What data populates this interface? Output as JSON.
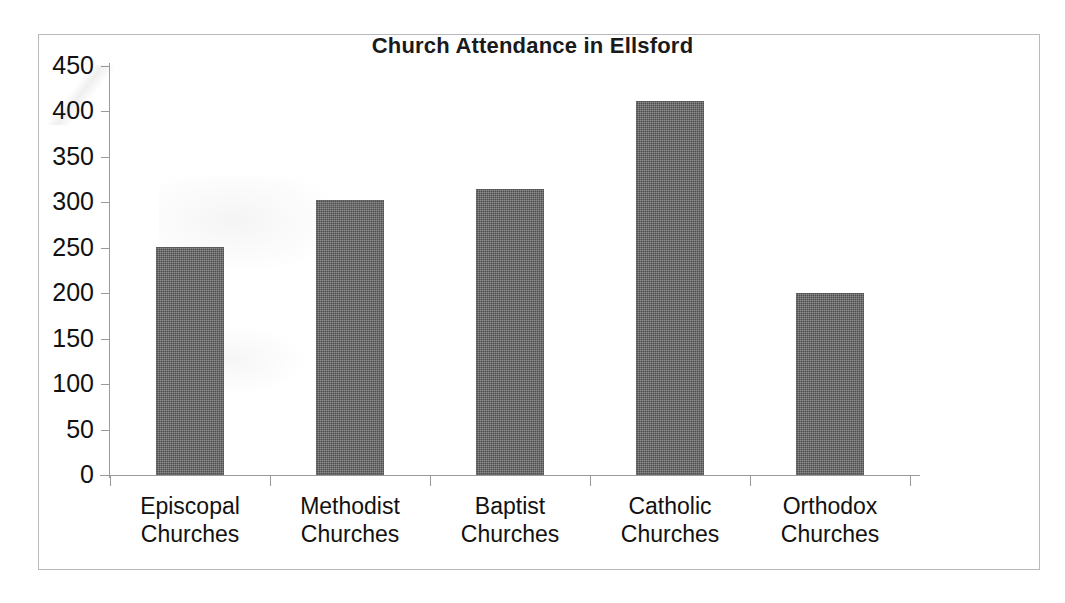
{
  "chart_data": {
    "type": "bar",
    "title": "Church Attendance in Ellsford",
    "xlabel": "",
    "ylabel": "",
    "categories": [
      "Episcopal Churches",
      "Methodist Churches",
      "Baptist Churches",
      "Catholic Churches",
      "Orthodox Churches"
    ],
    "category_lines": [
      [
        "Episcopal",
        "Churches"
      ],
      [
        "Methodist",
        "Churches"
      ],
      [
        "Baptist",
        "Churches"
      ],
      [
        "Catholic",
        "Churches"
      ],
      [
        "Orthodox",
        "Churches"
      ]
    ],
    "values": [
      251,
      303,
      315,
      411,
      200
    ],
    "ylim": [
      0,
      450
    ],
    "ytick_step": 50,
    "yticks": [
      450,
      400,
      350,
      300,
      250,
      200,
      150,
      100,
      50,
      0
    ],
    "ytick_labels": [
      "450",
      "400",
      "350",
      "300",
      "250",
      "200",
      "150",
      "100",
      "50",
      "0"
    ],
    "grid": false,
    "legend": false,
    "legend_position": "none",
    "bar_color": "#4d4d4d",
    "axis_color": "#9a9a9a",
    "text_color": "#111111",
    "background_color": "#ffffff",
    "frame_color": "#b9b9bd"
  }
}
